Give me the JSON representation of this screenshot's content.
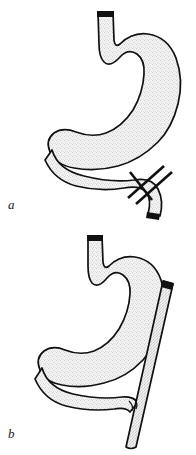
{
  "figure": {
    "title": "Gastric reconstruction schematic",
    "background_color": "#ffffff",
    "ink_color": "#111111",
    "fill_color": "#e8e8e8",
    "stipple_color": "#9a9a9a",
    "width": 196,
    "height": 455
  },
  "panels": [
    {
      "id": "a",
      "label": "a",
      "description": "Stomach with esophagus, duodenal loop and two parallel division marks across the descending duodenum",
      "parts": [
        {
          "name": "esophagus",
          "cut_end": "dark"
        },
        {
          "name": "stomach-body",
          "fill": "stipple"
        },
        {
          "name": "duodenal-loop",
          "fill": "stipple"
        },
        {
          "name": "descending-duodenum",
          "cut_end": "dark"
        },
        {
          "name": "division-marks",
          "count": 2,
          "style": "parallel-diagonal-bars"
        }
      ]
    },
    {
      "id": "b",
      "label": "b",
      "description": "Stomach with duodenal loop and a detached straight limb crossing the duodenum obliquely",
      "parts": [
        {
          "name": "esophagus",
          "cut_end": "dark"
        },
        {
          "name": "stomach-body",
          "fill": "stipple"
        },
        {
          "name": "duodenal-loop",
          "fill": "stipple"
        },
        {
          "name": "detached-limb",
          "cut_end": "dark",
          "orientation": "oblique"
        },
        {
          "name": "anastomosis-point",
          "style": "crossing"
        }
      ]
    }
  ]
}
